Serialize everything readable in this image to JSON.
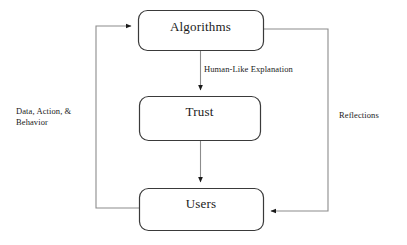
{
  "diagram": {
    "colors": {
      "node_stroke": "#3a3a3a",
      "node_fill": "#ffffff",
      "edge_stroke": "#8c8c8c",
      "arrowhead": "#1a1a1a",
      "text": "#1a1a1a",
      "background": "#ffffff"
    },
    "nodes": [
      {
        "id": "algorithms",
        "label": "Algorithms",
        "x": 138,
        "y": 10,
        "width": 125,
        "height": 40
      },
      {
        "id": "trust",
        "label": "Trust",
        "x": 139,
        "y": 96,
        "width": 121,
        "height": 44
      },
      {
        "id": "users",
        "label": "Users",
        "x": 139,
        "y": 188,
        "width": 124,
        "height": 42
      }
    ],
    "edges": [
      {
        "id": "algorithms-to-trust",
        "from": "algorithms",
        "to": "trust",
        "label": "Human-Like Explanation",
        "direction": "down"
      },
      {
        "id": "trust-to-users",
        "from": "trust",
        "to": "users",
        "label": "",
        "direction": "down"
      },
      {
        "id": "users-to-algorithms",
        "from": "users",
        "to": "algorithms",
        "label": "Data, Action, &\nBehavior",
        "label_line_1": "Data, Action, &",
        "label_line_2": "Behavior",
        "direction": "left-loop-up"
      },
      {
        "id": "algorithms-to-users",
        "from": "algorithms",
        "to": "users",
        "label": "Reflections",
        "direction": "right-loop-down"
      }
    ]
  }
}
